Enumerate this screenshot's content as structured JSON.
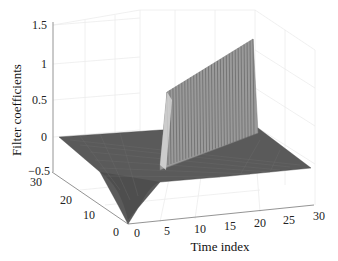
{
  "chart_data": {
    "type": "surface3d",
    "title": "",
    "xlabel": "Time index",
    "ylabel": "",
    "zlabel": "Filter coefficients",
    "x_ticks": [
      "0",
      "5",
      "10",
      "15",
      "20",
      "25",
      "30"
    ],
    "y_ticks": [
      "0",
      "10",
      "20",
      "30"
    ],
    "z_ticks": [
      "1.5",
      "1",
      "0.5",
      "0",
      "-0.5"
    ],
    "xlim": [
      0,
      30
    ],
    "ylim": [
      0,
      30
    ],
    "zlim": [
      -0.5,
      1.5
    ],
    "grid": true,
    "ridge": {
      "time_index": 5,
      "peak_values_start": 0.7,
      "peak_values_end": 1.35,
      "num_spikes": 30
    },
    "surface_color": "#555555",
    "ridge_color": "#9a9a9a"
  },
  "axes": {
    "z_label": "Filter coefficients",
    "x_label": "Time index",
    "z_tick_labels": [
      "1.5",
      "1",
      "0.5",
      "0",
      "−0.5"
    ],
    "y_tick_labels": [
      "30",
      "20",
      "10",
      "0"
    ],
    "x_tick_labels": [
      "0",
      "5",
      "10",
      "15",
      "20",
      "25",
      "30"
    ]
  }
}
